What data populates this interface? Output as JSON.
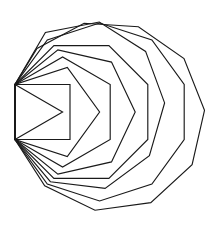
{
  "figure": {
    "canvas": {
      "width": 220,
      "height": 230,
      "background_color": "#ffffff"
    },
    "style": {
      "stroke_color": "#1a1a1a",
      "stroke_width": 1.15,
      "fill": "none",
      "line_join": "miter",
      "line_cap": "butt"
    },
    "anchors": {
      "top_vertex": {
        "x": 15.0,
        "y": 84.5,
        "label": "shared-upper-left-vertex"
      },
      "bottom_vertex": {
        "x": 15.0,
        "y": 139.5,
        "label": "shared-lower-left-vertex"
      }
    },
    "geometry_note": "Each polygon is a regular n-gon whose first edge is the fixed segment between the two shared left vertices; increasing n sweeps the remaining vertices further right, producing the nested fan.",
    "shapes": [
      {
        "name": "triangle",
        "sides": 3,
        "index": 0,
        "points": [
          [
            15.0,
            84.5
          ],
          [
            15.0,
            139.5
          ],
          [
            62.6,
            112.0
          ]
        ]
      },
      {
        "name": "square",
        "sides": 4,
        "index": 1,
        "points": [
          [
            15.0,
            84.5
          ],
          [
            15.0,
            139.5
          ],
          [
            70.0,
            139.5
          ],
          [
            70.0,
            84.5
          ]
        ]
      },
      {
        "name": "pentagon",
        "sides": 5,
        "index": 2,
        "points": [
          [
            15.0,
            84.5
          ],
          [
            15.0,
            139.5
          ],
          [
            67.3,
            156.5
          ],
          [
            99.6,
            112.0
          ],
          [
            67.3,
            67.5
          ]
        ]
      },
      {
        "name": "hexagon",
        "sides": 6,
        "index": 3,
        "points": [
          [
            15.0,
            84.5
          ],
          [
            15.0,
            139.5
          ],
          [
            62.6,
            167.0
          ],
          [
            110.2,
            139.5
          ],
          [
            110.2,
            84.5
          ],
          [
            62.6,
            57.0
          ]
        ]
      },
      {
        "name": "heptagon",
        "sides": 7,
        "index": 4,
        "points": [
          [
            15.0,
            84.5
          ],
          [
            15.0,
            139.5
          ],
          [
            57.9,
            174.1
          ],
          [
            111.5,
            161.9
          ],
          [
            135.2,
            112.0
          ],
          [
            111.5,
            62.1
          ],
          [
            57.9,
            49.9
          ]
        ]
      },
      {
        "name": "octagon",
        "sides": 8,
        "index": 5,
        "points": [
          [
            15.0,
            84.5
          ],
          [
            15.0,
            139.5
          ],
          [
            53.9,
            178.4
          ],
          [
            108.9,
            178.4
          ],
          [
            147.8,
            139.5
          ],
          [
            147.8,
            84.5
          ],
          [
            108.9,
            45.6
          ],
          [
            53.9,
            45.6
          ]
        ]
      },
      {
        "name": "nonagon",
        "sides": 9,
        "index": 6,
        "points": [
          [
            15.0,
            84.5
          ],
          [
            15.0,
            139.5
          ],
          [
            50.4,
            181.7
          ],
          [
            105.1,
            188.4
          ],
          [
            149.4,
            155.7
          ],
          [
            164.6,
            102.9
          ],
          [
            145.6,
            51.4
          ],
          [
            99.3,
            22.0
          ],
          [
            45.4,
            32.5
          ]
        ]
      },
      {
        "name": "decagon",
        "sides": 10,
        "index": 7,
        "points": [
          [
            15.0,
            84.5
          ],
          [
            15.0,
            139.5
          ],
          [
            47.3,
            184.0
          ],
          [
            99.6,
            201.0
          ],
          [
            151.9,
            184.0
          ],
          [
            184.2,
            139.5
          ],
          [
            184.2,
            84.5
          ],
          [
            151.9,
            40.0
          ],
          [
            99.6,
            23.0
          ],
          [
            47.3,
            40.0
          ]
        ]
      },
      {
        "name": "hendecagon",
        "sides": 11,
        "index": 8,
        "points": [
          [
            15.0,
            84.5
          ],
          [
            15.0,
            139.5
          ],
          [
            44.7,
            185.8
          ],
          [
            95.0,
            210.2
          ],
          [
            150.8,
            202.6
          ],
          [
            192.1,
            164.7
          ],
          [
            204.5,
            110.3
          ],
          [
            184.0,
            58.5
          ],
          [
            138.4,
            26.7
          ],
          [
            84.1,
            23.3
          ],
          [
            37.0,
            48.4
          ]
        ]
      }
    ]
  }
}
